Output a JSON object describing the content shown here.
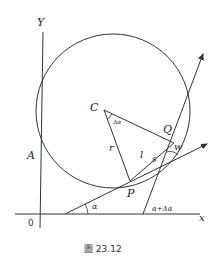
{
  "figure": {
    "caption": "圖 23.12",
    "axes": {
      "x_label": "x",
      "y_label": "Y",
      "origin_label": "0"
    },
    "points": {
      "center": "C",
      "P": "P",
      "Q": "Q",
      "A": "A"
    },
    "segment_labels": {
      "radius": "r",
      "chord": "l",
      "arc": "s",
      "angle_w": "w"
    },
    "angle_labels": {
      "alpha": "α",
      "alpha_plus_delta": "α+Δα",
      "delta_alpha": "Δα"
    },
    "colors": {
      "stroke": "#333333",
      "background": "#ffffff"
    }
  }
}
